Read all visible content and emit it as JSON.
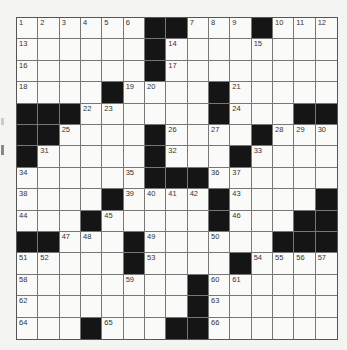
{
  "puzzle": {
    "rows": 15,
    "cols": 15,
    "black_cells": [
      [
        0,
        6
      ],
      [
        0,
        7
      ],
      [
        0,
        11
      ],
      [
        1,
        6
      ],
      [
        2,
        6
      ],
      [
        3,
        4
      ],
      [
        3,
        9
      ],
      [
        4,
        0
      ],
      [
        4,
        1
      ],
      [
        4,
        2
      ],
      [
        4,
        9
      ],
      [
        4,
        13
      ],
      [
        4,
        14
      ],
      [
        5,
        0
      ],
      [
        5,
        1
      ],
      [
        5,
        6
      ],
      [
        5,
        11
      ],
      [
        6,
        0
      ],
      [
        6,
        6
      ],
      [
        6,
        10
      ],
      [
        7,
        6
      ],
      [
        7,
        7
      ],
      [
        7,
        8
      ],
      [
        8,
        4
      ],
      [
        8,
        9
      ],
      [
        8,
        14
      ],
      [
        9,
        3
      ],
      [
        9,
        9
      ],
      [
        9,
        13
      ],
      [
        9,
        14
      ],
      [
        10,
        0
      ],
      [
        10,
        1
      ],
      [
        10,
        5
      ],
      [
        10,
        12
      ],
      [
        10,
        13
      ],
      [
        10,
        14
      ],
      [
        11,
        5
      ],
      [
        11,
        10
      ],
      [
        12,
        8
      ],
      [
        13,
        8
      ],
      [
        14,
        3
      ],
      [
        14,
        7
      ],
      [
        14,
        8
      ]
    ],
    "numbers": [
      {
        "r": 0,
        "c": 0,
        "n": "1"
      },
      {
        "r": 0,
        "c": 1,
        "n": "2"
      },
      {
        "r": 0,
        "c": 2,
        "n": "3"
      },
      {
        "r": 0,
        "c": 3,
        "n": "4"
      },
      {
        "r": 0,
        "c": 4,
        "n": "5"
      },
      {
        "r": 0,
        "c": 5,
        "n": "6"
      },
      {
        "r": 0,
        "c": 8,
        "n": "7"
      },
      {
        "r": 0,
        "c": 9,
        "n": "8"
      },
      {
        "r": 0,
        "c": 10,
        "n": "9"
      },
      {
        "r": 0,
        "c": 12,
        "n": "10"
      },
      {
        "r": 0,
        "c": 13,
        "n": "11"
      },
      {
        "r": 0,
        "c": 14,
        "n": "12"
      },
      {
        "r": 1,
        "c": 0,
        "n": "13"
      },
      {
        "r": 1,
        "c": 7,
        "n": "14"
      },
      {
        "r": 1,
        "c": 11,
        "n": "15"
      },
      {
        "r": 2,
        "c": 0,
        "n": "16"
      },
      {
        "r": 2,
        "c": 7,
        "n": "17"
      },
      {
        "r": 3,
        "c": 0,
        "n": "18"
      },
      {
        "r": 3,
        "c": 5,
        "n": "19"
      },
      {
        "r": 3,
        "c": 6,
        "n": "20"
      },
      {
        "r": 3,
        "c": 10,
        "n": "21"
      },
      {
        "r": 4,
        "c": 3,
        "n": "22"
      },
      {
        "r": 4,
        "c": 4,
        "n": "23"
      },
      {
        "r": 4,
        "c": 10,
        "n": "24"
      },
      {
        "r": 5,
        "c": 2,
        "n": "25"
      },
      {
        "r": 5,
        "c": 7,
        "n": "26"
      },
      {
        "r": 5,
        "c": 9,
        "n": "27"
      },
      {
        "r": 5,
        "c": 12,
        "n": "28"
      },
      {
        "r": 5,
        "c": 13,
        "n": "29"
      },
      {
        "r": 5,
        "c": 14,
        "n": "30"
      },
      {
        "r": 6,
        "c": 1,
        "n": "31"
      },
      {
        "r": 6,
        "c": 7,
        "n": "32"
      },
      {
        "r": 6,
        "c": 11,
        "n": "33"
      },
      {
        "r": 7,
        "c": 0,
        "n": "34"
      },
      {
        "r": 7,
        "c": 5,
        "n": "35"
      },
      {
        "r": 7,
        "c": 9,
        "n": "36"
      },
      {
        "r": 7,
        "c": 10,
        "n": "37"
      },
      {
        "r": 8,
        "c": 0,
        "n": "38"
      },
      {
        "r": 8,
        "c": 5,
        "n": "39"
      },
      {
        "r": 8,
        "c": 6,
        "n": "40"
      },
      {
        "r": 8,
        "c": 7,
        "n": "41"
      },
      {
        "r": 8,
        "c": 8,
        "n": "42"
      },
      {
        "r": 8,
        "c": 10,
        "n": "43"
      },
      {
        "r": 9,
        "c": 0,
        "n": "44"
      },
      {
        "r": 9,
        "c": 4,
        "n": "45"
      },
      {
        "r": 9,
        "c": 10,
        "n": "46"
      },
      {
        "r": 10,
        "c": 2,
        "n": "47"
      },
      {
        "r": 10,
        "c": 3,
        "n": "48"
      },
      {
        "r": 10,
        "c": 6,
        "n": "49"
      },
      {
        "r": 10,
        "c": 9,
        "n": "50"
      },
      {
        "r": 11,
        "c": 0,
        "n": "51"
      },
      {
        "r": 11,
        "c": 1,
        "n": "52"
      },
      {
        "r": 11,
        "c": 6,
        "n": "53"
      },
      {
        "r": 11,
        "c": 11,
        "n": "54"
      },
      {
        "r": 11,
        "c": 12,
        "n": "55"
      },
      {
        "r": 11,
        "c": 13,
        "n": "56"
      },
      {
        "r": 11,
        "c": 14,
        "n": "57"
      },
      {
        "r": 12,
        "c": 0,
        "n": "58"
      },
      {
        "r": 12,
        "c": 5,
        "n": "59"
      },
      {
        "r": 12,
        "c": 9,
        "n": "60"
      },
      {
        "r": 12,
        "c": 10,
        "n": "61"
      },
      {
        "r": 13,
        "c": 0,
        "n": "62"
      },
      {
        "r": 13,
        "c": 9,
        "n": "63"
      },
      {
        "r": 14,
        "c": 0,
        "n": "64"
      },
      {
        "r": 14,
        "c": 4,
        "n": "65"
      },
      {
        "r": 14,
        "c": 9,
        "n": "66"
      }
    ]
  }
}
